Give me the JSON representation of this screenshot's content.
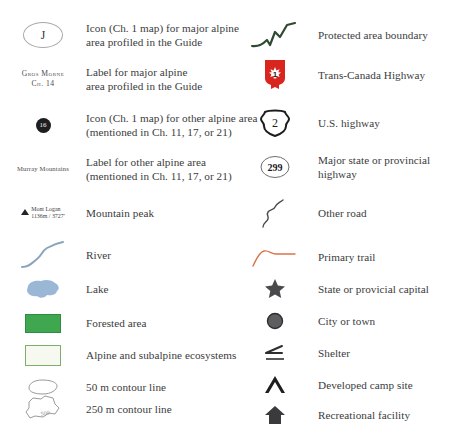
{
  "legend": {
    "colors": {
      "text": "#3b3b3d",
      "forest_green": "#3fa750",
      "alpine_border": "#7cb06a",
      "alpine_fill": "#f7f8ef",
      "lake_blue": "#9ab8d6",
      "river_blue": "#8aa4bd",
      "trail_orange": "#d9744a",
      "boundary_green": "#2f4a33",
      "highway_red": "#d8261f",
      "marker_gray": "#4a4a4c"
    },
    "left_column": [
      {
        "symbol": "major-alpine-circle-icon",
        "symbol_text": "J",
        "lines": [
          "Icon (Ch. 1 map) for major alpine",
          "area profiled in the Guide"
        ]
      },
      {
        "symbol": "major-alpine-label",
        "symbol_lines": [
          "Gros Morne",
          "Ch. 14"
        ],
        "lines": [
          "Label for major alpine",
          "area profiled in the Guide"
        ]
      },
      {
        "symbol": "other-alpine-dot-icon",
        "symbol_text": "16",
        "lines": [
          "Icon (Ch. 1 map) for other alpine area",
          "(mentioned in Ch. 11, 17, or 21)"
        ]
      },
      {
        "symbol": "other-alpine-label",
        "symbol_text": "Murray Mountains",
        "lines": [
          "Label for other alpine area",
          "(mentioned in Ch. 11, 17, or 21)"
        ]
      },
      {
        "symbol": "mountain-peak-icon",
        "symbol_lines": [
          "Mont Logan",
          "1136m / 3727'"
        ],
        "lines": [
          "Mountain peak"
        ]
      },
      {
        "symbol": "river-line-icon",
        "lines": [
          "River"
        ]
      },
      {
        "symbol": "lake-shape-icon",
        "lines": [
          "Lake"
        ]
      },
      {
        "symbol": "forested-area-swatch",
        "lines": [
          "Forested area"
        ]
      },
      {
        "symbol": "alpine-ecosystem-swatch",
        "lines": [
          "Alpine and subalpine ecosystems"
        ]
      },
      {
        "symbol": "contour-50m-icon",
        "lines": [
          "50 m contour line"
        ]
      },
      {
        "symbol": "contour-250m-icon",
        "symbol_text": "500",
        "lines": [
          "250 m contour line"
        ]
      }
    ],
    "right_column": [
      {
        "symbol": "protected-boundary-line-icon",
        "lines": [
          "Protected area boundary"
        ]
      },
      {
        "symbol": "trans-canada-shield-icon",
        "symbol_text": "1",
        "lines": [
          "Trans-Canada Highway"
        ]
      },
      {
        "symbol": "us-highway-shield-icon",
        "symbol_text": "2",
        "lines": [
          "U.S. highway"
        ]
      },
      {
        "symbol": "state-highway-circle-icon",
        "symbol_text": "299",
        "lines": [
          "Major state or provincial",
          "highway"
        ]
      },
      {
        "symbol": "other-road-line-icon",
        "lines": [
          "Other road"
        ]
      },
      {
        "symbol": "primary-trail-line-icon",
        "lines": [
          "Primary trail"
        ]
      },
      {
        "symbol": "capital-star-icon",
        "lines": [
          "State or provicial capital"
        ]
      },
      {
        "symbol": "city-dot-icon",
        "lines": [
          "City or town"
        ]
      },
      {
        "symbol": "shelter-icon",
        "lines": [
          "Shelter"
        ]
      },
      {
        "symbol": "campsite-icon",
        "lines": [
          "Developed camp site"
        ]
      },
      {
        "symbol": "recreational-facility-icon",
        "lines": [
          "Recreational facility"
        ]
      }
    ]
  }
}
